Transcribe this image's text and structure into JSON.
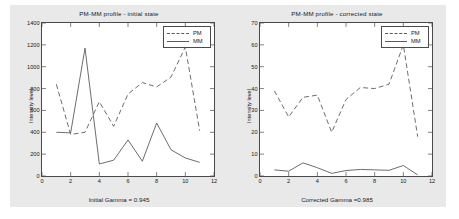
{
  "figure": {
    "background_color": "#e9e9e9",
    "plot_background_color": "#ffffff",
    "axis_color": "#4a4a4a",
    "series_color": "#5a5a5a"
  },
  "panels": [
    {
      "key": "initial",
      "title": "PM-MM profile - initial state",
      "xlabel_caption": "Initial Gamma = 0.945",
      "ylabel": "Intensity level",
      "legend": [
        {
          "label": "PM",
          "style": "dashed"
        },
        {
          "label": "MM",
          "style": "solid"
        }
      ]
    },
    {
      "key": "corrected",
      "title": "PM-MM profile - corrected state",
      "xlabel_caption": "Corrected Gamma =0.985",
      "ylabel": "Intensity level",
      "legend": [
        {
          "label": "PM",
          "style": "dashed"
        },
        {
          "label": "MM",
          "style": "solid"
        }
      ]
    }
  ],
  "chart_data": [
    {
      "type": "line",
      "title": "PM-MM profile - initial state",
      "xlabel": "Initial Gamma = 0.945",
      "ylabel": "Intensity level",
      "xlim": [
        0,
        12
      ],
      "ylim": [
        0,
        1400
      ],
      "xticks": [
        0,
        2,
        4,
        6,
        8,
        10,
        12
      ],
      "yticks": [
        0,
        200,
        400,
        600,
        800,
        1000,
        1200,
        1400
      ],
      "grid": false,
      "legend_position": "top-right",
      "x": [
        1,
        2,
        3,
        4,
        5,
        6,
        7,
        8,
        9,
        10,
        11
      ],
      "series": [
        {
          "name": "PM",
          "style": "dashed",
          "values": [
            840,
            380,
            400,
            680,
            455,
            750,
            855,
            815,
            905,
            1180,
            415
          ]
        },
        {
          "name": "MM",
          "style": "solid",
          "values": [
            400,
            395,
            1170,
            110,
            145,
            330,
            135,
            485,
            240,
            165,
            125
          ]
        }
      ]
    },
    {
      "type": "line",
      "title": "PM-MM profile - corrected state",
      "xlabel": "Corrected Gamma =0.985",
      "ylabel": "Intensity level",
      "xlim": [
        0,
        12
      ],
      "ylim": [
        0,
        70
      ],
      "xticks": [
        0,
        2,
        4,
        6,
        8,
        10,
        12
      ],
      "yticks": [
        0,
        10,
        20,
        30,
        40,
        50,
        60,
        70
      ],
      "grid": false,
      "legend_position": "top-right",
      "x": [
        1,
        2,
        3,
        4,
        5,
        6,
        7,
        8,
        9,
        10,
        11
      ],
      "series": [
        {
          "name": "PM",
          "style": "dashed",
          "values": [
            39,
            27,
            36,
            37,
            20,
            35,
            40.5,
            40,
            42,
            60,
            18
          ]
        },
        {
          "name": "MM",
          "style": "solid",
          "values": [
            2.8,
            2.2,
            6.0,
            3.8,
            1.2,
            2.5,
            3.0,
            2.8,
            2.6,
            4.8,
            0.5
          ]
        }
      ]
    }
  ]
}
